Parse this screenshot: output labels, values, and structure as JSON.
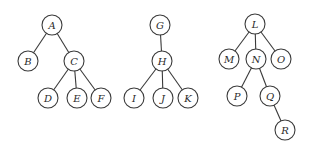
{
  "diagram": {
    "type": "forest",
    "node_radius": 10,
    "colors": {
      "stroke": "#3a3a3a",
      "fill": "#ffffff",
      "text": "#2a2a2a"
    },
    "trees": [
      {
        "name": "tree-1",
        "nodes": [
          {
            "id": "A",
            "label": "A",
            "x": 52,
            "y": 25
          },
          {
            "id": "B",
            "label": "B",
            "x": 28,
            "y": 61
          },
          {
            "id": "C",
            "label": "C",
            "x": 74,
            "y": 61
          },
          {
            "id": "D",
            "label": "D",
            "x": 48,
            "y": 98
          },
          {
            "id": "E",
            "label": "E",
            "x": 77,
            "y": 98
          },
          {
            "id": "F",
            "label": "F",
            "x": 101,
            "y": 98
          }
        ],
        "edges": [
          [
            "A",
            "B"
          ],
          [
            "A",
            "C"
          ],
          [
            "C",
            "D"
          ],
          [
            "C",
            "E"
          ],
          [
            "C",
            "F"
          ]
        ]
      },
      {
        "name": "tree-2",
        "nodes": [
          {
            "id": "G",
            "label": "G",
            "x": 160,
            "y": 25
          },
          {
            "id": "H",
            "label": "H",
            "x": 162,
            "y": 61
          },
          {
            "id": "I",
            "label": "I",
            "x": 134,
            "y": 98
          },
          {
            "id": "J",
            "label": "J",
            "x": 163,
            "y": 98
          },
          {
            "id": "K",
            "label": "K",
            "x": 188,
            "y": 98
          }
        ],
        "edges": [
          [
            "G",
            "H"
          ],
          [
            "H",
            "I"
          ],
          [
            "H",
            "J"
          ],
          [
            "H",
            "K"
          ]
        ]
      },
      {
        "name": "tree-3",
        "nodes": [
          {
            "id": "L",
            "label": "L",
            "x": 255,
            "y": 24
          },
          {
            "id": "M",
            "label": "M",
            "x": 229,
            "y": 59
          },
          {
            "id": "N",
            "label": "N",
            "x": 256,
            "y": 59
          },
          {
            "id": "O",
            "label": "O",
            "x": 281,
            "y": 59
          },
          {
            "id": "P",
            "label": "P",
            "x": 237,
            "y": 96
          },
          {
            "id": "Q",
            "label": "Q",
            "x": 270,
            "y": 96
          },
          {
            "id": "R",
            "label": "R",
            "x": 285,
            "y": 130
          }
        ],
        "edges": [
          [
            "L",
            "M"
          ],
          [
            "L",
            "N"
          ],
          [
            "L",
            "O"
          ],
          [
            "N",
            "P"
          ],
          [
            "N",
            "Q"
          ],
          [
            "Q",
            "R"
          ]
        ]
      }
    ]
  }
}
